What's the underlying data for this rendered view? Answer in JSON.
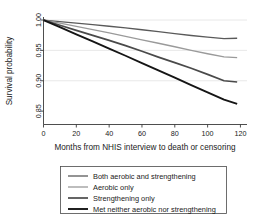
{
  "chart_data": {
    "type": "line",
    "title": "",
    "subtitle": "",
    "xlabel": "Months from NHIS interview to death or censoring",
    "ylabel": "Survival probability",
    "xlim": [
      0,
      124
    ],
    "ylim": [
      0.828,
      1.005
    ],
    "xticks": [
      0,
      20,
      40,
      60,
      80,
      100,
      120
    ],
    "xtick_labels": [
      "0",
      "20",
      "40",
      "60",
      "80",
      "100",
      "120"
    ],
    "yticks": [
      1.0,
      0.95,
      0.9,
      0.85
    ],
    "ytick_labels": [
      "1.00",
      "0.95",
      "0.90",
      "0.85"
    ],
    "grid": "horizontal",
    "gridlines_at": [
      1.0,
      0.95,
      0.9
    ],
    "legend_position": "below-plot",
    "x": [
      0,
      10,
      20,
      30,
      40,
      50,
      60,
      70,
      80,
      90,
      100,
      110,
      118
    ],
    "series": [
      {
        "name": "Both aerobic and strengthening",
        "color": "#5a5a5a",
        "width": 1.3,
        "values": [
          1.0,
          0.9975,
          0.995,
          0.9925,
          0.9898,
          0.987,
          0.984,
          0.9808,
          0.9775,
          0.9745,
          0.9718,
          0.9695,
          0.97
        ],
        "end_value": 0.97
      },
      {
        "name": "Aerobic only",
        "color": "#9a9a9a",
        "width": 1.3,
        "values": [
          1.0,
          0.9948,
          0.9896,
          0.9842,
          0.9788,
          0.9732,
          0.9675,
          0.9618,
          0.956,
          0.9502,
          0.9445,
          0.9392,
          0.938
        ],
        "end_value": 0.938
      },
      {
        "name": "Strengthening only",
        "color": "#4a4a4a",
        "width": 1.7,
        "values": [
          1.0,
          0.9915,
          0.983,
          0.9748,
          0.9665,
          0.9578,
          0.9485,
          0.939,
          0.9298,
          0.9205,
          0.9105,
          0.9,
          0.898
        ],
        "end_value": 0.898
      },
      {
        "name": "Met neither aerobic nor strengthening",
        "color": "#151515",
        "width": 1.9,
        "values": [
          1.0,
          0.9882,
          0.9765,
          0.9648,
          0.953,
          0.9412,
          0.9292,
          0.9172,
          0.905,
          0.893,
          0.8808,
          0.869,
          0.862
        ],
        "end_value": 0.862
      }
    ],
    "legend_entries": [
      "Both aerobic and strengthening",
      "Aerobic only",
      "Strengthening only",
      "Met neither aerobic nor strengthening"
    ]
  }
}
